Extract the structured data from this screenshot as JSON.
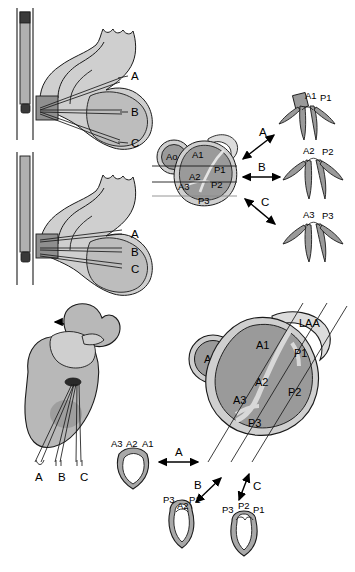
{
  "figure": {
    "colors": {
      "fill_dark": "#9a9a9a",
      "fill_mid": "#b3b3b3",
      "fill_light": "#cfcfcf",
      "fill_pale": "#dcdcdc",
      "stroke": "#1a1a1a",
      "background": "#ffffff",
      "probe_body": "#b0b0b0",
      "probe_tip": "#3a3a3a"
    }
  },
  "panel_top_left_upper": {
    "name": "sagittal-heart-view-upper",
    "plane_labels": [
      "A",
      "B",
      "C"
    ]
  },
  "panel_top_left_lower": {
    "name": "sagittal-heart-view-lower",
    "plane_labels": [
      "A",
      "B",
      "C"
    ]
  },
  "panel_top_middle": {
    "name": "mitral-valve-short-axis-small",
    "aorta_label": "Ao",
    "scallops": [
      "A1",
      "A2",
      "A3",
      "P1",
      "P2",
      "P3"
    ],
    "plane_labels": [
      "A",
      "B",
      "C"
    ]
  },
  "panel_top_right_valves": [
    {
      "name": "valve-cross-section-a1p1",
      "labels": [
        "A1",
        "P1"
      ]
    },
    {
      "name": "valve-cross-section-a2p2",
      "labels": [
        "A2",
        "P2"
      ]
    },
    {
      "name": "valve-cross-section-a3p3",
      "labels": [
        "A3",
        "P3"
      ]
    }
  ],
  "panel_bottom_left": {
    "name": "anterior-heart-view",
    "plane_labels": [
      "A",
      "B",
      "C"
    ]
  },
  "panel_bottom_right": {
    "name": "mitral-valve-en-face-large",
    "aorta_label": "Ao",
    "appendage_label": "LAA",
    "scallops": [
      "A1",
      "A2",
      "A3",
      "P1",
      "P2",
      "P3"
    ],
    "plane_labels": [
      "A",
      "B",
      "C"
    ]
  },
  "panel_bottom_valves": [
    {
      "name": "valve-view-commissural-a",
      "labels": [
        "A3",
        "A2",
        "A1"
      ]
    },
    {
      "name": "valve-view-commissural-b",
      "labels": [
        "P3",
        "A2",
        "P1"
      ]
    },
    {
      "name": "valve-view-commissural-c",
      "labels": [
        "P3",
        "P2",
        "P1"
      ]
    }
  ],
  "labels": {
    "A": "A",
    "B": "B",
    "C": "C",
    "Ao": "Ao",
    "LAA": "LAA",
    "A1": "A1",
    "A2": "A2",
    "A3": "A3",
    "P1": "P1",
    "P2": "P2",
    "P3": "P3"
  }
}
